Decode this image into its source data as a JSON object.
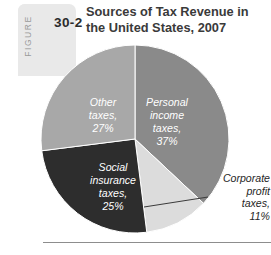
{
  "figure": {
    "word": "FIGURE",
    "number": "30-2",
    "title": "Sources of Tax Revenue in the United States, 2007"
  },
  "chart_data": {
    "type": "pie",
    "title": "Sources of Tax Revenue in the United States, 2007",
    "unit": "percent",
    "legend": "none",
    "labels_inside": true,
    "categories": [
      "Personal income taxes",
      "Corporate profit taxes",
      "Social insurance taxes",
      "Other taxes"
    ],
    "values": [
      37,
      11,
      25,
      27
    ],
    "colors": [
      "#8a8a8a",
      "#dcdcdc",
      "#2d2d2d",
      "#a8a8a8"
    ],
    "slices": [
      {
        "name": "personal-income-taxes",
        "label_lines": [
          "Personal",
          "income",
          "taxes,",
          "37%"
        ],
        "value": 37,
        "color": "#8a8a8a",
        "label_color": "#ffffff",
        "label_placement": "inside"
      },
      {
        "name": "corporate-profit-taxes",
        "label_lines": [
          "Corporate",
          "profit",
          "taxes,",
          "11%"
        ],
        "value": 11,
        "color": "#dcdcdc",
        "label_color": "#262626",
        "label_placement": "callout-right"
      },
      {
        "name": "social-insurance-taxes",
        "label_lines": [
          "Social",
          "insurance",
          "taxes,",
          "25%"
        ],
        "value": 25,
        "color": "#2d2d2d",
        "label_color": "#ffffff",
        "label_placement": "inside"
      },
      {
        "name": "other-taxes",
        "label_lines": [
          "Other",
          "taxes,",
          "27%"
        ],
        "value": 27,
        "color": "#a8a8a8",
        "label_color": "#ffffff",
        "label_placement": "inside"
      }
    ]
  }
}
